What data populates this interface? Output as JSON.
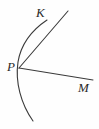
{
  "figure": {
    "background_color": "#fefefe",
    "stroke_color": "#3a3a3a",
    "label_color": "#2b2b2b",
    "labels": [
      {
        "id": "K",
        "text": "K",
        "x": 36,
        "y": 6
      },
      {
        "id": "P",
        "text": "P",
        "x": 7,
        "y": 60
      },
      {
        "id": "M",
        "text": "M",
        "x": 78,
        "y": 81
      }
    ],
    "points": {
      "P": {
        "x": 19,
        "y": 68
      },
      "K": {
        "x": 43,
        "y": 26
      },
      "M": {
        "x": 93,
        "y": 80
      }
    },
    "strokes": [
      {
        "id": "arc",
        "kind": "arc",
        "description": "circular arc passing through P, bowing left, from upper area near K down to lower right",
        "path": "M 47 20 C 32 30 21 44 18 62 C 15 82 21 104 33 121"
      },
      {
        "id": "chord-PK",
        "kind": "line",
        "description": "straight segment from P up through K continuing to upper right",
        "path": "M 19 68 L 68 11"
      },
      {
        "id": "ray-PM",
        "kind": "line",
        "description": "straight ray from P sloping gently down to the right ending at M",
        "path": "M 19 68 L 93 80"
      }
    ]
  }
}
